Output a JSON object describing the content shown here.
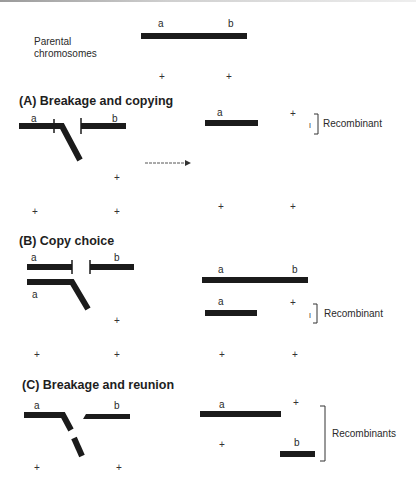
{
  "parental": {
    "label_line1": "Parental",
    "label_line2": "chromosomes",
    "marker_a": "a",
    "marker_b": "b",
    "plus_left": "+",
    "plus_right": "+"
  },
  "sections": [
    {
      "id": "A",
      "title": "(A)  Breakage and copying",
      "left": {
        "a": "a",
        "b": "b",
        "plus_mid": "+",
        "plus_bl": "+",
        "plus_br": "+"
      },
      "right": {
        "a": "a",
        "plus_top": "+",
        "small_mark": "I",
        "bracket_label": "Recombinant",
        "plus_bl": "+",
        "plus_br": "+"
      },
      "arrow": "right-arrow"
    },
    {
      "id": "B",
      "title": "(B)  Copy choice",
      "left": {
        "a_top": "a",
        "b_top": "b",
        "a_bottom": "a",
        "plus_mid": "+",
        "plus_bl": "+",
        "plus_br": "+"
      },
      "right": {
        "a_top": "a",
        "b_top": "b",
        "a_bottom": "a",
        "plus_top": "+",
        "small_mark": "I",
        "bracket_label": "Recombinant",
        "plus_bl": "+",
        "plus_br": "+"
      }
    },
    {
      "id": "C",
      "title": "(C) Breakage and reunion",
      "left": {
        "a": "a",
        "b": "b",
        "plus_bl": "+",
        "plus_br": "+"
      },
      "right": {
        "a": "a",
        "plus_top": "+",
        "plus_mid": "+",
        "b": "b",
        "bracket_label": "Recombinants"
      }
    }
  ],
  "colors": {
    "chromosome": "#1b1b1b",
    "text": "#2a2a2a",
    "background": "#ffffff"
  }
}
